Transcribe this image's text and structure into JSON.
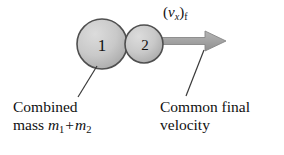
{
  "figure": {
    "background_color": "#ffffff",
    "topic": "perfectly-inelastic-collision-final-state"
  },
  "balls": [
    {
      "number": "1",
      "cx": 102,
      "cy": 44,
      "r": 25,
      "fill": "#c4c4c4",
      "stroke": "#4a4a4a"
    },
    {
      "number": "2",
      "cx": 144,
      "cy": 44,
      "r": 19,
      "fill": "#c4c4c4",
      "stroke": "#4a4a4a"
    }
  ],
  "arrow": {
    "label_text": "(vx)f",
    "label_open_paren": "(",
    "label_variable": "v",
    "label_sub_x": "x",
    "label_close_paren": ")",
    "label_sub_f": "f",
    "color": "#a3a3a3",
    "stroke": "#8a8a8a",
    "start_x": 161,
    "tip_x": 226,
    "y": 41,
    "shaft_height": 7,
    "head_width": 22,
    "head_height": 20
  },
  "leaders": [
    {
      "name": "combined-mass-leader",
      "x1": 97,
      "y1": 66,
      "x2": 78,
      "y2": 97,
      "color": "#3a3a3a"
    },
    {
      "name": "common-velocity-leader",
      "x1": 204,
      "y1": 50,
      "x2": 186,
      "y2": 96,
      "color": "#3a3a3a"
    }
  ],
  "captions": {
    "combined_mass": {
      "line1": "Combined",
      "line2_prefix": "mass",
      "mass_symbol_1": "m",
      "mass_subscript_1": "1",
      "operator": "+",
      "mass_symbol_2": "m",
      "mass_subscript_2": "2"
    },
    "common_velocity": {
      "line1": "Common final",
      "line2": "velocity"
    }
  }
}
